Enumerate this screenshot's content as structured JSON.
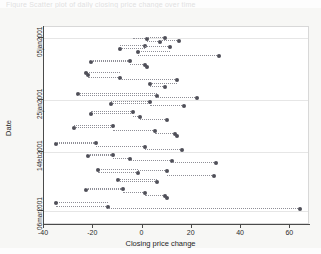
{
  "top_caption": "Figure  Scatter plot of daily closing price change over time",
  "chart_data": {
    "type": "scatter",
    "title": "",
    "xlabel": "Closing price change",
    "ylabel": "Date",
    "xlim": [
      -40,
      68
    ],
    "ylim_labels": [
      "05jan2001",
      "25jan2001",
      "14feb2001",
      "06mar2001"
    ],
    "xticks": [
      -40,
      -20,
      0,
      20,
      40,
      60
    ],
    "xtick_labels": [
      "-40",
      "-20",
      "0",
      "20",
      "40",
      "60"
    ],
    "yticks": [
      "05jan2001",
      "25jan2001",
      "14feb2001",
      "06mar2001"
    ],
    "grid": true,
    "grid_axis": "y",
    "legend": "none",
    "marker": "filled-circle",
    "marker_color": "#4f4f58",
    "connector": "dotted-horizontal-spike",
    "connector_color": "#8f8f97",
    "points": [
      {
        "x": 2,
        "y_px": 29,
        "spike_to": -4
      },
      {
        "x": 9,
        "y_px": 28,
        "spike_to": 2
      },
      {
        "x": 7,
        "y_px": 32,
        "spike_to": 2
      },
      {
        "x": 15,
        "y_px": 31,
        "spike_to": 7
      },
      {
        "x": -9,
        "y_px": 39,
        "spike_to": 1
      },
      {
        "x": 1,
        "y_px": 36,
        "spike_to": -9
      },
      {
        "x": 11,
        "y_px": 37,
        "spike_to": 1
      },
      {
        "x": -2,
        "y_px": 42,
        "spike_to": 11
      },
      {
        "x": 31,
        "y_px": 46,
        "spike_to": -2
      },
      {
        "x": -21,
        "y_px": 52,
        "spike_to": -5
      },
      {
        "x": -5,
        "y_px": 51,
        "spike_to": -21
      },
      {
        "x": 1,
        "y_px": 55,
        "spike_to": -5
      },
      {
        "x": 2,
        "y_px": 57,
        "spike_to": 1
      },
      {
        "x": -23,
        "y_px": 63,
        "spike_to": -9
      },
      {
        "x": -22,
        "y_px": 65,
        "spike_to": -23
      },
      {
        "x": -9,
        "y_px": 68,
        "spike_to": -22
      },
      {
        "x": 14,
        "y_px": 70,
        "spike_to": -9
      },
      {
        "x": 3,
        "y_px": 74,
        "spike_to": 14
      },
      {
        "x": 9,
        "y_px": 77,
        "spike_to": 3
      },
      {
        "x": -26,
        "y_px": 84,
        "spike_to": 6
      },
      {
        "x": 6,
        "y_px": 86,
        "spike_to": -26
      },
      {
        "x": 22,
        "y_px": 88,
        "spike_to": 6
      },
      {
        "x": -13,
        "y_px": 94,
        "spike_to": 3
      },
      {
        "x": 3,
        "y_px": 92,
        "spike_to": -13
      },
      {
        "x": 17,
        "y_px": 96,
        "spike_to": 3
      },
      {
        "x": -21,
        "y_px": 104,
        "spike_to": -4
      },
      {
        "x": -4,
        "y_px": 102,
        "spike_to": -21
      },
      {
        "x": -1,
        "y_px": 107,
        "spike_to": -4
      },
      {
        "x": 10,
        "y_px": 110,
        "spike_to": -1
      },
      {
        "x": -28,
        "y_px": 118,
        "spike_to": -12
      },
      {
        "x": -12,
        "y_px": 116,
        "spike_to": -28
      },
      {
        "x": 5,
        "y_px": 121,
        "spike_to": -12
      },
      {
        "x": 13,
        "y_px": 124,
        "spike_to": 5
      },
      {
        "x": 14,
        "y_px": 126,
        "spike_to": 13
      },
      {
        "x": -35,
        "y_px": 134,
        "spike_to": -19
      },
      {
        "x": -19,
        "y_px": 133,
        "spike_to": -35
      },
      {
        "x": 1,
        "y_px": 137,
        "spike_to": -19
      },
      {
        "x": 16,
        "y_px": 140,
        "spike_to": 1
      },
      {
        "x": -22,
        "y_px": 146,
        "spike_to": -12
      },
      {
        "x": -12,
        "y_px": 145,
        "spike_to": -22
      },
      {
        "x": -5,
        "y_px": 149,
        "spike_to": -12
      },
      {
        "x": 12,
        "y_px": 151,
        "spike_to": -5
      },
      {
        "x": 30,
        "y_px": 153,
        "spike_to": 12
      },
      {
        "x": -18,
        "y_px": 160,
        "spike_to": -2
      },
      {
        "x": -2,
        "y_px": 163,
        "spike_to": -18
      },
      {
        "x": 10,
        "y_px": 161,
        "spike_to": -2
      },
      {
        "x": 29,
        "y_px": 166,
        "spike_to": 10
      },
      {
        "x": -10,
        "y_px": 170,
        "spike_to": 6
      },
      {
        "x": 6,
        "y_px": 172,
        "spike_to": -10
      },
      {
        "x": -23,
        "y_px": 180,
        "spike_to": -8
      },
      {
        "x": -8,
        "y_px": 179,
        "spike_to": -23
      },
      {
        "x": 1,
        "y_px": 183,
        "spike_to": -8
      },
      {
        "x": 9,
        "y_px": 186,
        "spike_to": 1
      },
      {
        "x": 10,
        "y_px": 188,
        "spike_to": 9
      },
      {
        "x": -35,
        "y_px": 193,
        "spike_to": -14
      },
      {
        "x": -14,
        "y_px": 197,
        "spike_to": -35
      },
      {
        "x": 64,
        "y_px": 199,
        "spike_to": -14
      }
    ]
  }
}
